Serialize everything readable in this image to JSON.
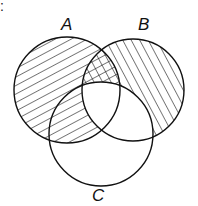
{
  "corner_mark": ":",
  "sets": [
    {
      "name": "A",
      "cx": 67,
      "cy": 90,
      "r": 53,
      "hatch": "forward-slash"
    },
    {
      "name": "B",
      "cx": 133,
      "cy": 90,
      "r": 51,
      "hatch": "back-slash"
    },
    {
      "name": "C",
      "cx": 101,
      "cy": 134,
      "r": 52,
      "hatch": "none"
    }
  ],
  "labels": {
    "a": "A",
    "b": "B",
    "c": "C"
  },
  "shaded_description": "A hatched except A∩B∩C; B hatched except B∩C; A∩B−C cross-hatched",
  "stroke_color": "#111111"
}
